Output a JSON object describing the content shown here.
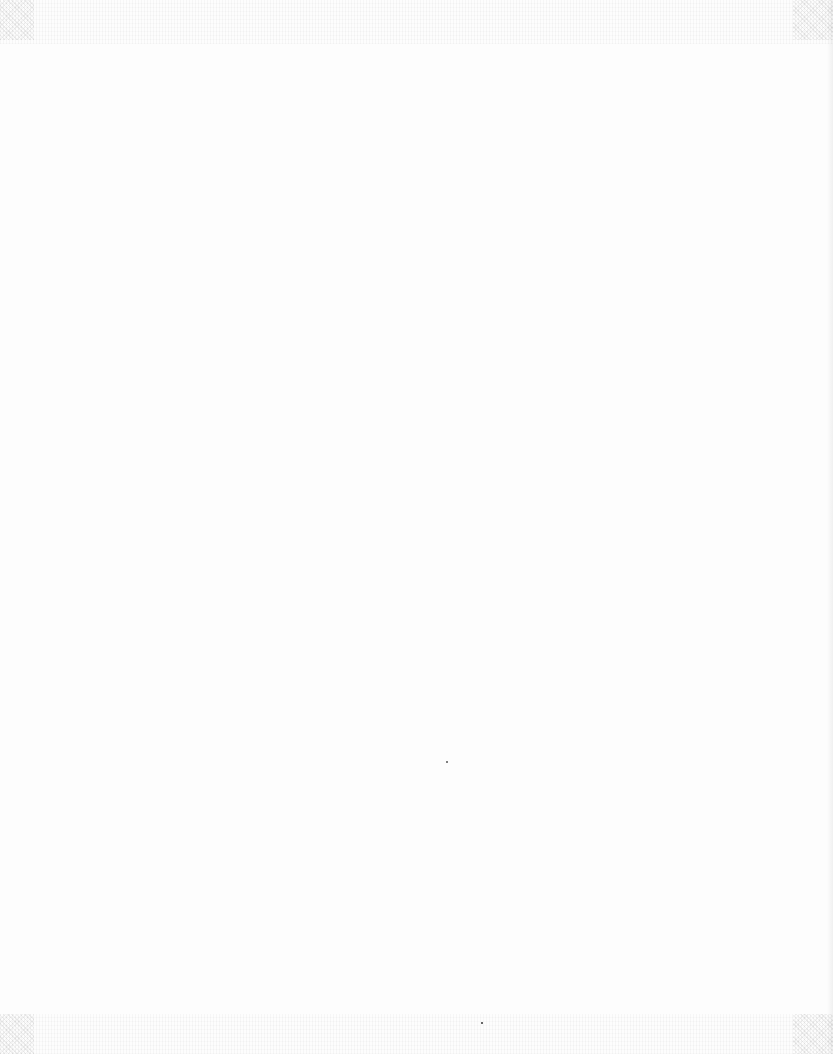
{
  "page": {
    "type": "scanned-document-page",
    "content": "blank",
    "background_color": "#fdfdfd",
    "text": ""
  }
}
